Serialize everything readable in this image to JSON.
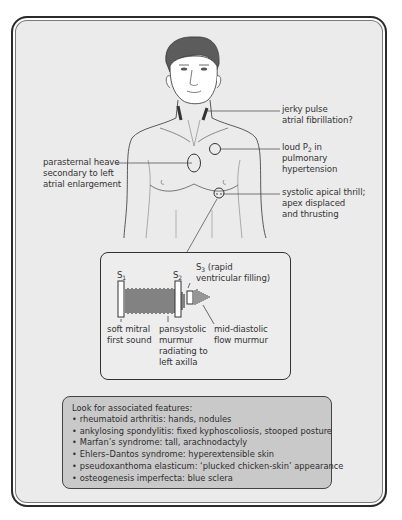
{
  "figure": {
    "annotations": {
      "neck": {
        "line1": "jerky pulse",
        "line2": "atrial fibrillation?"
      },
      "p2": {
        "line1_prefix": "loud P",
        "line1_sub": "2",
        "line1_suffix": " in",
        "line2": "pulmonary",
        "line3": "hypertension"
      },
      "parasternal": {
        "line1": "parasternal heave",
        "line2": "secondary to left",
        "line3": "atrial enlargement"
      },
      "apex": {
        "line1": "systolic apical thrill;",
        "line2": "apex displaced",
        "line3": "and thrusting"
      }
    }
  },
  "phonocardiogram": {
    "s1_label": {
      "main": "S",
      "sub": "1"
    },
    "s2_label": {
      "main": "S",
      "sub": "2"
    },
    "s3_label": {
      "main": "S",
      "sub": "3",
      "suffix": " (rapid",
      "line2": "ventricular filling)"
    },
    "captions": {
      "s1": {
        "line1": "soft mitral",
        "line2": "first sound"
      },
      "murmur": {
        "line1": "pansystolic",
        "line2": "murmur",
        "line3": "radiating to",
        "line4": "left axilla"
      },
      "diastolic": {
        "line1": "mid-diastolic",
        "line2": "flow murmur"
      }
    }
  },
  "features": {
    "title": "Look for associated features:",
    "items": [
      "rheumatoid arthritis: hands, nodules",
      "ankylosing spondylitis: fixed kyphoscoliosis, stooped posture",
      "Marfan’s syndrome: tall, arachnodactyly",
      "Ehlers–Dantos syndrome: hyperextensible skin",
      "pseudoxanthoma elasticum: ‘plucked chicken-skin’ appearance",
      "osteogenesis imperfecta: blue sclera"
    ],
    "bullet": "•"
  },
  "colors": {
    "panel_bg": "#ebebeb",
    "feature_box_bg": "#c9c9c9",
    "hair": "#5a5a5a",
    "line": "#333333"
  }
}
